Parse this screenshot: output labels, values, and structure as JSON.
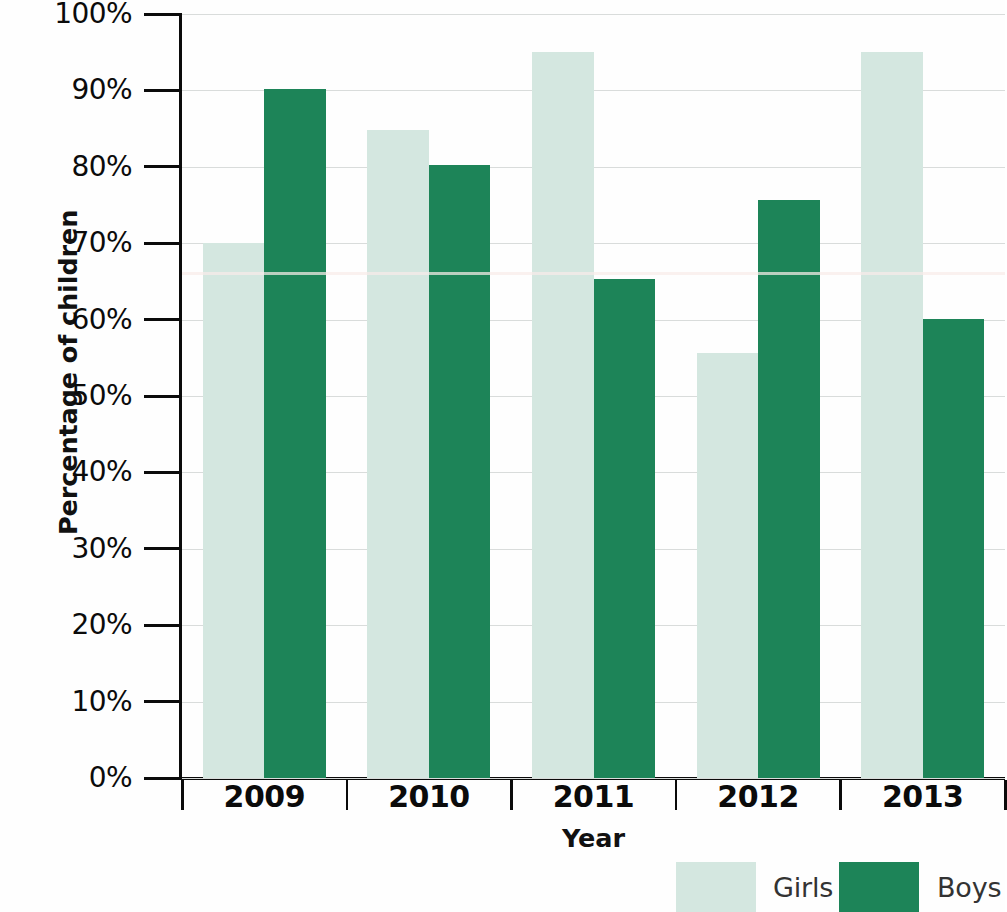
{
  "chart_data": {
    "type": "bar",
    "title": "",
    "xlabel": "Year",
    "ylabel": "Percentage of children",
    "categories": [
      "2009",
      "2010",
      "2011",
      "2012",
      "2013"
    ],
    "series": [
      {
        "name": "Girls",
        "color": "#d4e7e0",
        "values": [
          70.0,
          84.8,
          95.0,
          55.6,
          95.0
        ]
      },
      {
        "name": "Boys",
        "color": "#1d8458",
        "values": [
          90.2,
          80.3,
          65.3,
          75.6,
          60.1
        ]
      }
    ],
    "ylim": [
      0,
      100
    ],
    "ytick_labels": [
      "0%",
      "10%",
      "20%",
      "30%",
      "40%",
      "50%",
      "60%",
      "70%",
      "80%",
      "90%",
      "100%"
    ],
    "ytick_values": [
      0,
      10,
      20,
      30,
      40,
      50,
      60,
      70,
      80,
      90,
      100
    ],
    "grid": true,
    "grid_color": "#d9dcdb",
    "legend_position": "bottom-right",
    "legend": [
      {
        "label": "Girls",
        "color": "#d4e7e0"
      },
      {
        "label": "Boys",
        "color": "#1d8458"
      }
    ],
    "axis_color": "#0b0b0b",
    "background": "#ffffff"
  }
}
